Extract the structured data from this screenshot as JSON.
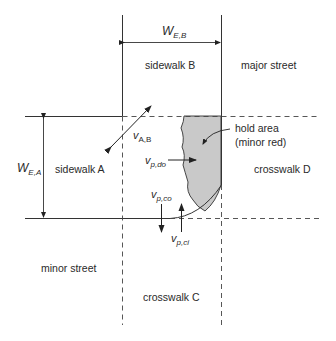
{
  "diagram": {
    "type": "intersection corner pedestrian flow diagram",
    "labels": {
      "sidewalk_a": "sidewalk A",
      "sidewalk_b": "sidewalk B",
      "major_street": "major street",
      "minor_street": "minor street",
      "crosswalk_c": "crosswalk C",
      "crosswalk_d": "crosswalk D",
      "hold_area_line1": "hold area",
      "hold_area_line2": "(minor red)"
    },
    "symbols": {
      "w_eb": {
        "main": "W",
        "sub": "E,B"
      },
      "w_ea": {
        "main": "W",
        "sub": "E,A"
      },
      "v_ab": {
        "main": "v",
        "sub": "A,B"
      },
      "v_pdo": {
        "main": "v",
        "sub": "p,do"
      },
      "v_pco": {
        "main": "v",
        "sub": "p,co"
      },
      "v_pci": {
        "main": "v",
        "sub": "p,ci"
      }
    },
    "colors": {
      "line": "#333333",
      "hold_area_fill": "#c9c9c9"
    }
  }
}
